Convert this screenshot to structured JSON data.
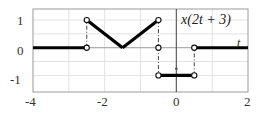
{
  "figure": {
    "kind": "signal-plot",
    "signal_label": "x(2t + 3)",
    "time_axis_label": "t",
    "frame": {
      "left_px": 33,
      "right_px": 248,
      "top_px": 9,
      "bottom_px": 92
    },
    "colors": {
      "curve": "#000000",
      "frame": "#9a9a9a",
      "grid": "#e2e2e2",
      "axis": "#9a9a9a",
      "text": "#333333",
      "background": "#ffffff"
    }
  },
  "chart_data": {
    "type": "line",
    "title": "x(2t + 3)",
    "xlabel": "t",
    "ylabel": "",
    "xlim": [
      -4,
      2
    ],
    "ylim": [
      -1.6,
      1.4
    ],
    "grid": true,
    "legend": null,
    "xticks": [
      -4,
      -2,
      0,
      2
    ],
    "xtick_labels": [
      "-4",
      "-2",
      "0",
      "2"
    ],
    "yticks": [
      -1,
      0,
      1
    ],
    "ytick_labels": [
      "-1",
      "0",
      "1"
    ],
    "minor_gridlines_x": [
      -3,
      -1,
      1
    ],
    "minor_gridlines_y": [
      -0.5,
      0.5
    ],
    "segments": [
      {
        "name": "zero-left",
        "points": [
          [
            -4,
            0
          ],
          [
            -2.5,
            0
          ]
        ]
      },
      {
        "name": "ramp-down",
        "points": [
          [
            -2.5,
            1
          ],
          [
            -1.5,
            0
          ]
        ]
      },
      {
        "name": "ramp-up",
        "points": [
          [
            -1.5,
            0
          ],
          [
            -0.5,
            1
          ]
        ]
      },
      {
        "name": "negative-pulse",
        "points": [
          [
            -0.5,
            -1
          ],
          [
            0.5,
            -1
          ]
        ]
      },
      {
        "name": "zero-right",
        "points": [
          [
            0.5,
            0
          ],
          [
            2,
            0
          ]
        ]
      }
    ],
    "open_points": [
      [
        -2.5,
        0
      ],
      [
        -2.5,
        1
      ],
      [
        -0.5,
        1
      ],
      [
        -0.5,
        0
      ],
      [
        -0.5,
        -1
      ],
      [
        0.5,
        -1
      ],
      [
        0.5,
        0
      ]
    ],
    "discontinuity_connectors": [
      {
        "x": -2.5,
        "y_from": 0,
        "y_to": 1
      },
      {
        "x": -0.5,
        "y_from": 1,
        "y_to": -1
      },
      {
        "x": 0.5,
        "y_from": -1,
        "y_to": 0
      }
    ]
  }
}
